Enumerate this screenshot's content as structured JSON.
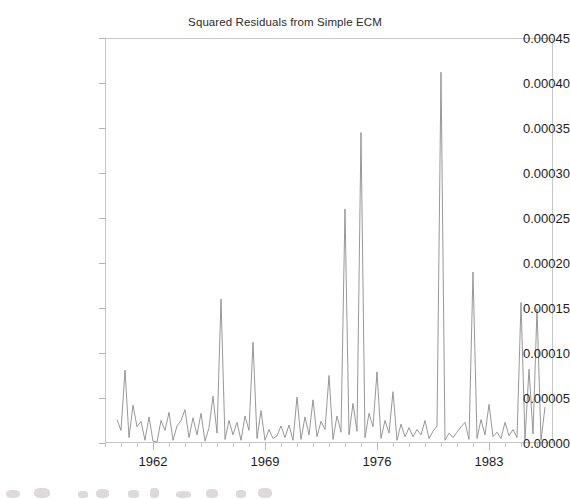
{
  "chart_data": {
    "type": "line",
    "title": "Squared Residuals from Simple ECM",
    "xlabel": "",
    "ylabel": "",
    "xlim": [
      1959.0,
      1987.0
    ],
    "ylim": [
      0.0,
      0.00045
    ],
    "grid": false,
    "legend": false,
    "x_tick_labels": [
      "1962",
      "1969",
      "1976",
      "1983"
    ],
    "x_tick_values": [
      1962,
      1969,
      1976,
      1983
    ],
    "y_tick_labels": [
      "0.00045",
      "0.00040",
      "0.00035",
      "0.00030",
      "0.00025",
      "0.00020",
      "0.00015",
      "0.00010",
      "0.00005",
      "0.00000"
    ],
    "y_tick_values": [
      0.00045,
      0.0004,
      0.00035,
      0.0003,
      0.00025,
      0.0002,
      0.00015,
      0.0001,
      5e-05,
      0.0
    ],
    "series_name": "Squared Residuals",
    "line_color": "#8c8c8c",
    "x": [
      1959.75,
      1960.0,
      1960.25,
      1960.5,
      1960.75,
      1961.0,
      1961.25,
      1961.5,
      1961.75,
      1962.0,
      1962.25,
      1962.5,
      1962.75,
      1963.0,
      1963.25,
      1963.5,
      1963.75,
      1964.0,
      1964.25,
      1964.5,
      1964.75,
      1965.0,
      1965.25,
      1965.5,
      1965.75,
      1966.0,
      1966.25,
      1966.5,
      1966.75,
      1967.0,
      1967.25,
      1967.5,
      1967.75,
      1968.0,
      1968.25,
      1968.5,
      1968.75,
      1969.0,
      1969.25,
      1969.5,
      1969.75,
      1970.0,
      1970.25,
      1970.5,
      1970.75,
      1971.0,
      1971.25,
      1971.5,
      1971.75,
      1972.0,
      1972.25,
      1972.5,
      1972.75,
      1973.0,
      1973.25,
      1973.5,
      1973.75,
      1974.0,
      1974.25,
      1974.5,
      1974.75,
      1975.0,
      1975.25,
      1975.5,
      1975.75,
      1976.0,
      1976.25,
      1976.5,
      1976.75,
      1977.0,
      1977.25,
      1977.5,
      1977.75,
      1978.0,
      1978.25,
      1978.5,
      1978.75,
      1979.0,
      1979.25,
      1979.5,
      1979.75,
      1980.0,
      1980.25,
      1980.5,
      1980.75,
      1981.0,
      1981.25,
      1981.5,
      1981.75,
      1982.0,
      1982.25,
      1982.5,
      1982.75,
      1983.0,
      1983.25,
      1983.5,
      1983.75,
      1984.0,
      1984.25,
      1984.5,
      1984.75,
      1985.0,
      1985.25,
      1985.5,
      1985.75,
      1986.0,
      1986.25,
      1986.5
    ],
    "y": [
      2.6e-05,
      1.4e-05,
      8.1e-05,
      6e-06,
      4.2e-05,
      1.8e-05,
      2.4e-05,
      3e-06,
      2.9e-05,
      2e-06,
      1e-06,
      2.5e-05,
      1.4e-05,
      3.4e-05,
      3e-06,
      1.9e-05,
      2.5e-05,
      3.7e-05,
      6e-06,
      2.8e-05,
      9e-06,
      3.3e-05,
      2e-06,
      1.7e-05,
      5.2e-05,
      1.1e-05,
      0.00016,
      4e-06,
      2.5e-05,
      9e-06,
      2.3e-05,
      3e-06,
      3e-05,
      1.4e-05,
      0.000112,
      5e-06,
      3.6e-05,
      3e-06,
      1.5e-05,
      5e-06,
      8e-06,
      1.9e-05,
      6e-06,
      2e-05,
      3e-06,
      5.1e-05,
      4e-06,
      2.9e-05,
      9e-06,
      4.8e-05,
      7e-06,
      2.4e-05,
      1.5e-05,
      7.5e-05,
      4e-06,
      3e-05,
      1.2e-05,
      0.00026,
      9e-06,
      4.4e-05,
      1.3e-05,
      0.000345,
      6e-06,
      3.3e-05,
      1.8e-05,
      7.9e-05,
      5e-06,
      2.5e-05,
      1.1e-05,
      5.7e-05,
      3e-06,
      2.1e-05,
      7e-06,
      1.7e-05,
      7e-06,
      1.5e-05,
      9e-06,
      2.5e-05,
      5e-06,
      1.3e-05,
      1.9e-05,
      0.000412,
      3e-06,
      1.1e-05,
      6e-06,
      1.2e-05,
      1.8e-05,
      2.3e-05,
      4e-06,
      0.00019,
      5e-06,
      2.6e-05,
      9e-06,
      4.3e-05,
      7e-06,
      1.2e-05,
      5e-06,
      2.3e-05,
      8e-06,
      1.5e-05,
      6e-06,
      0.000156,
      4e-06,
      8.2e-05,
      1e-05,
      0.000149,
      3e-06,
      4e-05
    ]
  }
}
